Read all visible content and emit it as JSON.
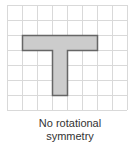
{
  "diagram": {
    "grid": {
      "origin_x": 7,
      "origin_y": 5,
      "cell_size": 15,
      "columns": 8,
      "rows": 7,
      "line_color": "#d9d9d9"
    },
    "shape": {
      "name": "T-shape",
      "fill": "#cccccc",
      "stroke": "#666666",
      "cells_polygon": [
        [
          1,
          2
        ],
        [
          6,
          2
        ],
        [
          6,
          3
        ],
        [
          4,
          3
        ],
        [
          4,
          6
        ],
        [
          3,
          6
        ],
        [
          3,
          3
        ],
        [
          1,
          3
        ]
      ]
    },
    "caption": {
      "line1": "No rotational",
      "line2": "symmetry"
    }
  }
}
